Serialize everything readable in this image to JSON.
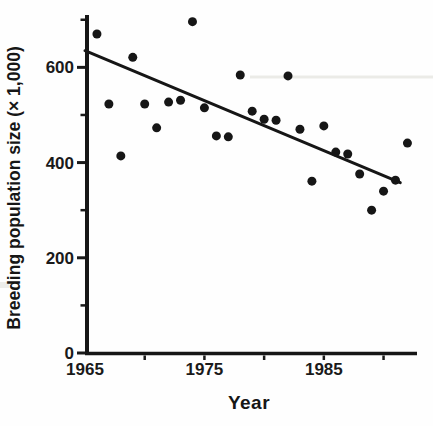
{
  "figure": {
    "background": "#fefefe",
    "ink_color": "#1a1a1a",
    "marker_color": "#161616"
  },
  "chart_data": {
    "type": "scatter",
    "title": "",
    "xlabel": "Year",
    "ylabel": "Breeding population size (× 1,000)",
    "xlim": [
      1965,
      1992.8
    ],
    "ylim": [
      0,
      710
    ],
    "grid": false,
    "legend": null,
    "x_labeled_ticks": [
      1965,
      1975,
      1985
    ],
    "x_tick_marks": [
      1970,
      1975,
      1980,
      1985,
      1990
    ],
    "y_labeled_ticks": [
      0,
      200,
      400,
      600
    ],
    "y_minor_ticks": [
      100,
      300,
      500,
      700
    ],
    "marker": {
      "shape": "circle",
      "radius_px": 4.5,
      "color": "#161616"
    },
    "points": [
      [
        1966,
        670
      ],
      [
        1967,
        523
      ],
      [
        1968,
        414
      ],
      [
        1969,
        621
      ],
      [
        1970,
        523
      ],
      [
        1971,
        473
      ],
      [
        1972,
        527
      ],
      [
        1973,
        531
      ],
      [
        1974,
        696
      ],
      [
        1975,
        515
      ],
      [
        1976,
        456
      ],
      [
        1977,
        454
      ],
      [
        1978,
        584
      ],
      [
        1979,
        508
      ],
      [
        1980,
        491
      ],
      [
        1981,
        489
      ],
      [
        1982,
        582
      ],
      [
        1983,
        470
      ],
      [
        1984,
        361
      ],
      [
        1985,
        477
      ],
      [
        1986,
        422
      ],
      [
        1987,
        418
      ],
      [
        1988,
        376
      ],
      [
        1989,
        300
      ],
      [
        1990,
        340
      ],
      [
        1991,
        363
      ],
      [
        1992,
        441
      ]
    ],
    "trend_line": {
      "x1": 1965,
      "y1": 635,
      "x2": 1991.4,
      "y2": 358,
      "color": "#161616"
    }
  }
}
